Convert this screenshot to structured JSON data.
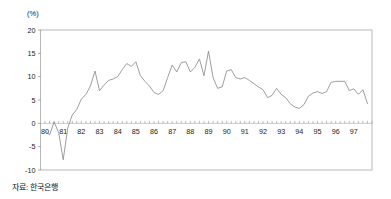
{
  "figure": {
    "unit_label": "(%)",
    "source_label": "자료: 한국은행"
  },
  "chart_data": {
    "type": "line",
    "title": "",
    "subtitle": "",
    "xlabel": "",
    "ylabel": "(%)",
    "unit": "%",
    "source": "자료: 한국은행",
    "grid": false,
    "legend": false,
    "legend_position": "none",
    "series_color": "#8c8c8c",
    "xlim": [
      1979.75,
      1998.0
    ],
    "ylim": [
      -10,
      20
    ],
    "yticks": [
      -10,
      -5,
      0,
      5,
      10,
      15,
      20
    ],
    "ytick_labels": [
      "-10",
      "-5",
      "0",
      "5",
      "10",
      "15",
      "20"
    ],
    "xticks": [
      1980,
      1981,
      1982,
      1983,
      1984,
      1985,
      1986,
      1987,
      1988,
      1989,
      1990,
      1991,
      1992,
      1993,
      1994,
      1995,
      1996,
      1997
    ],
    "xtick_labels": [
      "80",
      "81",
      "82",
      "83",
      "84",
      "85",
      "86",
      "87",
      "88",
      "89",
      "90",
      "91",
      "92",
      "93",
      "94",
      "95",
      "96",
      "97"
    ],
    "x_minor_interval": 0.25,
    "zero_line": 0,
    "series": [
      {
        "name": "성장률",
        "x": [
          1980.0,
          1980.25,
          1980.5,
          1980.75,
          1981.0,
          1981.25,
          1981.5,
          1981.75,
          1982.0,
          1982.25,
          1982.5,
          1982.75,
          1983.0,
          1983.25,
          1983.5,
          1983.75,
          1984.0,
          1984.25,
          1984.5,
          1984.75,
          1985.0,
          1985.25,
          1985.5,
          1985.75,
          1986.0,
          1986.25,
          1986.5,
          1986.75,
          1987.0,
          1987.25,
          1987.5,
          1987.75,
          1988.0,
          1988.25,
          1988.5,
          1988.75,
          1989.0,
          1989.25,
          1989.5,
          1989.75,
          1990.0,
          1990.25,
          1990.5,
          1990.75,
          1991.0,
          1991.25,
          1991.5,
          1991.75,
          1992.0,
          1992.25,
          1992.5,
          1992.75,
          1993.0,
          1993.25,
          1993.5,
          1993.75,
          1994.0,
          1994.25,
          1994.5,
          1994.75,
          1995.0,
          1995.25,
          1995.5,
          1995.75,
          1996.0,
          1996.25,
          1996.5,
          1996.75,
          1997.0,
          1997.25,
          1997.5,
          1997.75
        ],
        "values": [
          -1.5,
          -2.5,
          0.3,
          -2.0,
          -7.8,
          -1.0,
          1.8,
          3.0,
          5.2,
          6.2,
          8.0,
          11.2,
          7.0,
          8.2,
          9.2,
          9.5,
          10.0,
          11.5,
          12.8,
          12.2,
          13.2,
          10.2,
          9.0,
          8.0,
          6.6,
          6.2,
          7.0,
          9.8,
          12.5,
          11.0,
          13.0,
          13.2,
          11.0,
          12.0,
          13.8,
          10.2,
          15.5,
          9.8,
          7.5,
          7.8,
          11.2,
          11.5,
          9.8,
          9.5,
          9.8,
          9.2,
          8.5,
          7.8,
          7.2,
          5.5,
          6.0,
          7.5,
          6.2,
          5.5,
          4.2,
          3.5,
          3.2,
          4.0,
          5.8,
          6.5,
          6.8,
          6.4,
          6.8,
          8.8,
          9.0,
          9.0,
          9.0,
          7.0,
          7.4,
          6.2,
          7.2,
          4.2
        ]
      }
    ],
    "annotations": []
  }
}
